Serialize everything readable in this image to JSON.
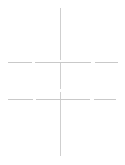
{
  "page": {
    "width": 125,
    "height": 165,
    "background_color": "#ffffff"
  },
  "palette": {
    "line_color": "#c9c9c9",
    "line_color_light": "#dedede",
    "line_color_mid": "#d2d2d2",
    "background": "#ffffff"
  },
  "chart_data": {
    "type": "line",
    "title": "",
    "subtitle": "",
    "xlabel": "",
    "ylabel": "",
    "grid": false,
    "legend": "none",
    "xlim": [
      0,
      125
    ],
    "ylim": [
      0,
      165
    ],
    "annotations": [],
    "tick_labels": {
      "x": [],
      "y": []
    },
    "series": [
      {
        "name": "vertical-axis-line",
        "orientation": "vertical",
        "x": 60,
        "y_start": 8,
        "y_end": 158,
        "stroke": "#cfcfcf",
        "stroke_width": 1,
        "dash_pattern": "52 3 26 3 64",
        "values": [
          8,
          158
        ]
      },
      {
        "name": "upper-horizontal-line",
        "orientation": "horizontal",
        "y": 62,
        "x_start": 8,
        "x_end": 118,
        "stroke": "#c9c9c9",
        "stroke_width": 1,
        "dash_pattern": "24 3 56 4 23",
        "values": [
          8,
          118
        ]
      },
      {
        "name": "lower-horizontal-line",
        "orientation": "horizontal",
        "y": 99,
        "x_start": 8,
        "x_end": 116,
        "stroke": "#c9c9c9",
        "stroke_width": 1,
        "dash_pattern": "25 3 54 4 22",
        "values": [
          8,
          116
        ]
      }
    ],
    "intersections": [
      {
        "name": "upper-crossing",
        "x": 60,
        "y": 62
      },
      {
        "name": "lower-crossing",
        "x": 60,
        "y": 99
      }
    ]
  },
  "labels": {
    "empty": ""
  }
}
